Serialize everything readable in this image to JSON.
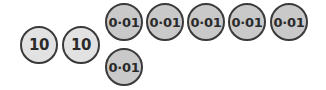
{
  "diagram": {
    "colors": {
      "ten_fill": "#e2e2e2",
      "hundredth_fill": "#c9c9c9",
      "outline": "#3a3a3a",
      "text": "#2a2a2a"
    },
    "tens_counters": [
      {
        "label": "10"
      },
      {
        "label": "10"
      }
    ],
    "hundredths_counters": [
      {
        "label": "0·01"
      },
      {
        "label": "0·01"
      },
      {
        "label": "0·01"
      },
      {
        "label": "0·01"
      },
      {
        "label": "0·01"
      },
      {
        "label": "0·01"
      }
    ]
  }
}
